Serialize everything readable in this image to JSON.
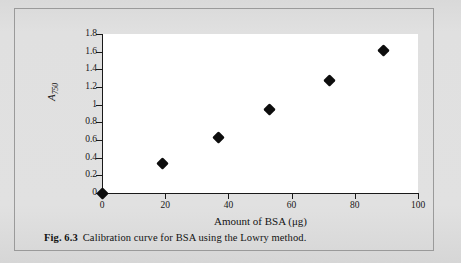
{
  "figure": {
    "caption_number": "Fig. 6.3",
    "caption_text": "Calibration curve for BSA using the Lowry method.",
    "frame_color": "#9a9a9a",
    "page_background": "#dcdcdc",
    "plot_background": "#ffffff",
    "ink_color": "#0d0d0d"
  },
  "chart_data": {
    "type": "scatter",
    "title": "",
    "xlabel": "Amount of BSA (μg)",
    "ylabel": "A750",
    "ylabel_base": "A",
    "ylabel_sub": "750",
    "xlim": [
      0,
      100
    ],
    "ylim": [
      0,
      1.8
    ],
    "grid": false,
    "legend": false,
    "marker": "filled-diamond",
    "xticks": [
      0,
      20,
      40,
      60,
      80,
      100
    ],
    "xtick_labels": [
      "0",
      "20",
      "40",
      "60",
      "80",
      "100"
    ],
    "yticks": [
      0,
      0.2,
      0.4,
      0.6,
      0.8,
      1.0,
      1.2,
      1.4,
      1.6,
      1.8
    ],
    "ytick_labels": [
      "0",
      "0.2",
      "0.4",
      "0.6",
      "0.8",
      "1",
      "1.2",
      "1.4",
      "1.6",
      "1.8"
    ],
    "x": [
      0,
      19,
      37,
      53,
      72,
      89
    ],
    "y": [
      0,
      0.33,
      0.63,
      0.95,
      1.27,
      1.61
    ],
    "points": [
      {
        "x": 0,
        "y": 0.0
      },
      {
        "x": 19,
        "y": 0.33
      },
      {
        "x": 37,
        "y": 0.63
      },
      {
        "x": 53,
        "y": 0.95
      },
      {
        "x": 72,
        "y": 1.27
      },
      {
        "x": 89,
        "y": 1.61
      }
    ]
  }
}
